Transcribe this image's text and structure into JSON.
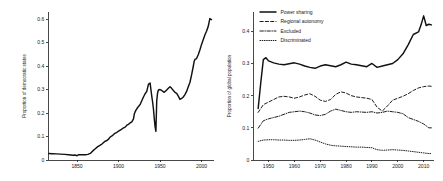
{
  "figure": {
    "background": "#ffffff",
    "ink_color": "#111111"
  },
  "chart_data": [
    {
      "id": "democracy",
      "type": "line",
      "title": "",
      "xlabel": "",
      "ylabel": "Proportion of democratic states",
      "xlim": [
        1815,
        2015
      ],
      "ylim": [
        0,
        0.63
      ],
      "xticks": [
        1850,
        1900,
        1950,
        2000
      ],
      "xtick_labels": [
        "1850",
        "1900",
        "1950",
        "2000"
      ],
      "yticks": [
        0,
        0.1,
        0.2,
        0.3,
        0.4,
        0.5,
        0.6
      ],
      "ytick_labels": [
        "0",
        "0.1",
        "0.2",
        "0.3",
        "0.4",
        "0.5",
        "0.6"
      ],
      "grid": false,
      "legend": "none",
      "series": [
        {
          "name": "Proportion of democratic states",
          "style": "solid",
          "x": [
            1816,
            1820,
            1825,
            1830,
            1835,
            1840,
            1845,
            1848,
            1850,
            1852,
            1855,
            1860,
            1863,
            1866,
            1868,
            1870,
            1872,
            1875,
            1878,
            1880,
            1883,
            1886,
            1888,
            1890,
            1893,
            1895,
            1898,
            1900,
            1903,
            1905,
            1908,
            1910,
            1912,
            1914,
            1916,
            1918,
            1919,
            1920,
            1921,
            1922,
            1924,
            1926,
            1928,
            1930,
            1932,
            1934,
            1936,
            1938,
            1939,
            1940,
            1941,
            1942,
            1943,
            1944,
            1945,
            1946,
            1947,
            1948,
            1950,
            1952,
            1955,
            1958,
            1960,
            1962,
            1964,
            1966,
            1968,
            1970,
            1972,
            1974,
            1976,
            1978,
            1980,
            1982,
            1984,
            1986,
            1988,
            1990,
            1991,
            1992,
            1994,
            1996,
            1998,
            2000,
            2002,
            2004,
            2006,
            2008,
            2010,
            2012
          ],
          "y": [
            0.028,
            0.027,
            0.026,
            0.025,
            0.024,
            0.022,
            0.02,
            0.021,
            0.018,
            0.023,
            0.022,
            0.022,
            0.024,
            0.028,
            0.035,
            0.042,
            0.048,
            0.057,
            0.063,
            0.068,
            0.078,
            0.083,
            0.089,
            0.098,
            0.105,
            0.112,
            0.118,
            0.123,
            0.129,
            0.135,
            0.14,
            0.148,
            0.152,
            0.158,
            0.162,
            0.175,
            0.196,
            0.205,
            0.212,
            0.218,
            0.228,
            0.236,
            0.252,
            0.268,
            0.282,
            0.292,
            0.322,
            0.328,
            0.3,
            0.272,
            0.248,
            0.218,
            0.178,
            0.142,
            0.122,
            0.252,
            0.285,
            0.298,
            0.3,
            0.296,
            0.288,
            0.298,
            0.305,
            0.312,
            0.305,
            0.296,
            0.288,
            0.284,
            0.272,
            0.258,
            0.262,
            0.268,
            0.278,
            0.292,
            0.312,
            0.33,
            0.362,
            0.398,
            0.418,
            0.428,
            0.432,
            0.448,
            0.468,
            0.492,
            0.512,
            0.532,
            0.548,
            0.568,
            0.602,
            0.598
          ]
        }
      ]
    },
    {
      "id": "ethnic-power-access",
      "type": "line",
      "title": "",
      "xlabel": "",
      "ylabel": "Proportion of global population",
      "xlim": [
        1944,
        2014
      ],
      "ylim": [
        0,
        0.46
      ],
      "xticks": [
        1950,
        1960,
        1970,
        1980,
        1990,
        2000,
        2010
      ],
      "xtick_labels": [
        "1950",
        "1960",
        "1970",
        "1980",
        "1990",
        "2000",
        "2010"
      ],
      "yticks": [
        0,
        0.1,
        0.2,
        0.3,
        0.4
      ],
      "ytick_labels": [
        "0",
        "0.1",
        "0.2",
        "0.3",
        "0.4"
      ],
      "grid": false,
      "legend": "upper-left",
      "series": [
        {
          "name": "Power sharing",
          "style": "solid",
          "x": [
            1946,
            1947,
            1948,
            1949,
            1950,
            1952,
            1954,
            1956,
            1958,
            1960,
            1962,
            1964,
            1966,
            1968,
            1970,
            1972,
            1974,
            1976,
            1978,
            1980,
            1982,
            1984,
            1986,
            1988,
            1990,
            1992,
            1994,
            1996,
            1998,
            2000,
            2002,
            2004,
            2006,
            2008,
            2009,
            2010,
            2011,
            2012,
            2013
          ],
          "y": [
            0.16,
            0.24,
            0.312,
            0.318,
            0.308,
            0.302,
            0.298,
            0.296,
            0.299,
            0.302,
            0.298,
            0.292,
            0.288,
            0.285,
            0.292,
            0.296,
            0.293,
            0.29,
            0.296,
            0.304,
            0.298,
            0.296,
            0.293,
            0.29,
            0.3,
            0.288,
            0.292,
            0.296,
            0.3,
            0.312,
            0.33,
            0.358,
            0.39,
            0.398,
            0.42,
            0.448,
            0.418,
            0.422,
            0.42
          ]
        },
        {
          "name": "Regional autonomy",
          "style": "dashed",
          "x": [
            1946,
            1948,
            1950,
            1952,
            1954,
            1956,
            1958,
            1960,
            1962,
            1964,
            1966,
            1968,
            1970,
            1972,
            1974,
            1976,
            1978,
            1980,
            1982,
            1984,
            1986,
            1988,
            1990,
            1992,
            1994,
            1996,
            1998,
            2000,
            2002,
            2004,
            2006,
            2008,
            2010,
            2012,
            2013
          ],
          "y": [
            0.148,
            0.172,
            0.18,
            0.188,
            0.196,
            0.198,
            0.196,
            0.192,
            0.196,
            0.202,
            0.206,
            0.198,
            0.186,
            0.182,
            0.188,
            0.204,
            0.212,
            0.208,
            0.2,
            0.196,
            0.194,
            0.192,
            0.188,
            0.164,
            0.152,
            0.168,
            0.186,
            0.192,
            0.198,
            0.206,
            0.216,
            0.224,
            0.228,
            0.23,
            0.229
          ]
        },
        {
          "name": "Excluded",
          "style": "dashdot",
          "x": [
            1946,
            1948,
            1950,
            1952,
            1954,
            1956,
            1958,
            1960,
            1962,
            1964,
            1966,
            1968,
            1970,
            1972,
            1974,
            1976,
            1978,
            1980,
            1982,
            1984,
            1986,
            1988,
            1990,
            1992,
            1994,
            1996,
            1998,
            2000,
            2002,
            2004,
            2006,
            2008,
            2010,
            2012,
            2013
          ],
          "y": [
            0.099,
            0.122,
            0.128,
            0.132,
            0.136,
            0.142,
            0.148,
            0.15,
            0.152,
            0.15,
            0.146,
            0.14,
            0.138,
            0.142,
            0.152,
            0.158,
            0.154,
            0.15,
            0.148,
            0.15,
            0.149,
            0.148,
            0.15,
            0.146,
            0.148,
            0.152,
            0.15,
            0.148,
            0.144,
            0.132,
            0.126,
            0.12,
            0.112,
            0.1,
            0.1
          ]
        },
        {
          "name": "Discriminated",
          "style": "dotted",
          "x": [
            1946,
            1948,
            1950,
            1952,
            1954,
            1956,
            1958,
            1960,
            1962,
            1964,
            1966,
            1968,
            1970,
            1972,
            1974,
            1976,
            1978,
            1980,
            1982,
            1984,
            1986,
            1988,
            1990,
            1992,
            1994,
            1996,
            1998,
            2000,
            2002,
            2004,
            2006,
            2008,
            2010,
            2012,
            2013
          ],
          "y": [
            0.058,
            0.062,
            0.063,
            0.063,
            0.062,
            0.062,
            0.061,
            0.061,
            0.062,
            0.064,
            0.066,
            0.062,
            0.056,
            0.05,
            0.046,
            0.044,
            0.043,
            0.042,
            0.041,
            0.04,
            0.04,
            0.039,
            0.038,
            0.032,
            0.03,
            0.031,
            0.032,
            0.031,
            0.03,
            0.028,
            0.026,
            0.024,
            0.022,
            0.02,
            0.02
          ]
        }
      ]
    }
  ]
}
